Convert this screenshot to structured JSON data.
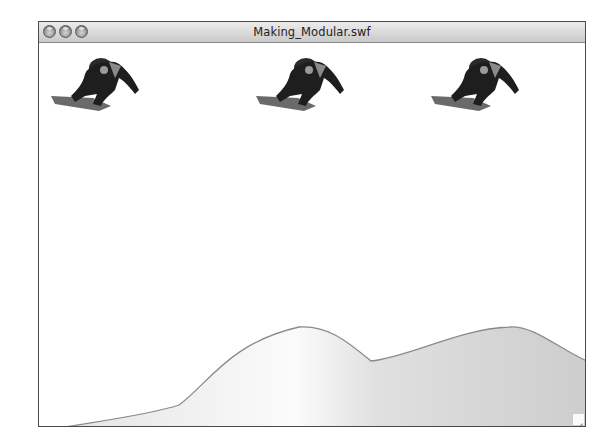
{
  "window": {
    "title": "Making_Modular.swf",
    "controls": [
      {
        "name": "close",
        "icon": "close-icon"
      },
      {
        "name": "minimize",
        "icon": "minimize-icon"
      },
      {
        "name": "zoom",
        "icon": "zoom-icon"
      }
    ]
  },
  "stage": {
    "background": "#ffffff",
    "terrain": {
      "stroke": "#8a8a8a",
      "fill_light": "#ffffff",
      "fill_dark": "#cfcfcf"
    },
    "sprites": [
      {
        "name": "snowboarder-1",
        "icon": "snowboarder-icon",
        "x": 10,
        "y": 13
      },
      {
        "name": "snowboarder-2",
        "icon": "snowboarder-icon",
        "x": 215,
        "y": 13
      },
      {
        "name": "snowboarder-3",
        "icon": "snowboarder-icon",
        "x": 390,
        "y": 13
      }
    ]
  }
}
